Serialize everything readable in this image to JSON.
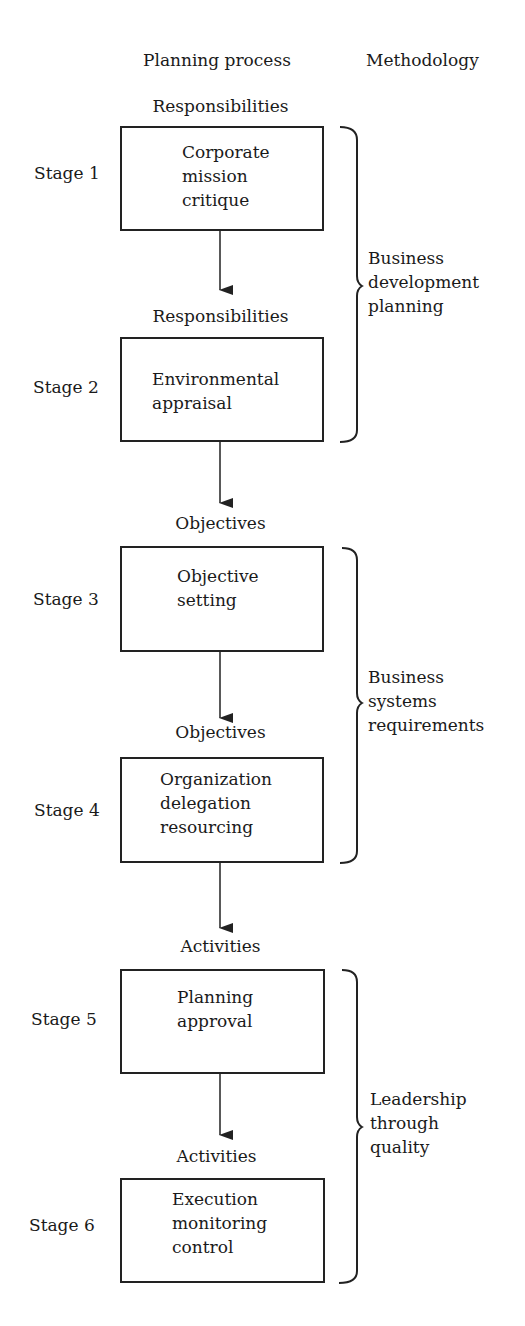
{
  "headers": {
    "planning_process": "Planning process",
    "methodology": "Methodology"
  },
  "stages": [
    {
      "label": "Stage 1",
      "input_label": "Responsibilities",
      "box_lines": [
        "Corporate",
        "mission",
        "critique"
      ]
    },
    {
      "label": "Stage 2",
      "input_label": "Responsibilities",
      "box_lines": [
        "Environmental",
        "appraisal"
      ]
    },
    {
      "label": "Stage 3",
      "input_label": "Objectives",
      "box_lines": [
        "Objective",
        "setting"
      ]
    },
    {
      "label": "Stage 4",
      "input_label": "Objectives",
      "box_lines": [
        "Organization",
        "delegation",
        "resourcing"
      ]
    },
    {
      "label": "Stage 5",
      "input_label": "Activities",
      "box_lines": [
        "Planning",
        "approval"
      ]
    },
    {
      "label": "Stage 6",
      "input_label": "Activities",
      "box_lines": [
        "Execution",
        "monitoring",
        "control"
      ]
    }
  ],
  "stage_text": {
    "s1": "Corporate\nmission\ncritique",
    "s2": "Environmental\nappraisal",
    "s3": "Objective\nsetting",
    "s4": "Organization\ndelegation\nresourcing",
    "s5": "Planning\napproval",
    "s6": "Execution\nmonitoring\ncontrol"
  },
  "methodologies": [
    {
      "text": "Business\ndevelopment\nplanning",
      "spans_stages": [
        1,
        2
      ]
    },
    {
      "text": "Business\nsystems\nrequirements",
      "spans_stages": [
        3,
        4
      ]
    },
    {
      "text": "Leadership\nthrough\nquality",
      "spans_stages": [
        5,
        6
      ]
    }
  ]
}
